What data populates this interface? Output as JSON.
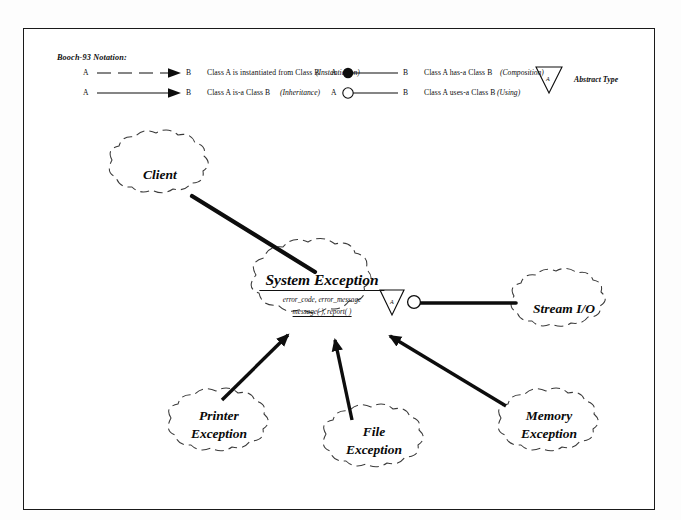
{
  "diagram": {
    "title": "Booch-93 Notation:",
    "legend": {
      "rows": [
        {
          "from": "A",
          "to": "B",
          "description": "Class A  is instantiated from  Class B",
          "kind": "(Instantiation)",
          "symbol": "dashed-arrow-icon"
        },
        {
          "from": "A",
          "to": "B",
          "description": "Class A  is-a Class B",
          "kind": "(Inheritance)",
          "symbol": "solid-arrow-icon"
        },
        {
          "from": "A",
          "to": "B",
          "description": "Class A  has-a  Class B",
          "kind": "(Composition)",
          "symbol": "filled-circle-line-icon"
        },
        {
          "from": "A",
          "to": "B",
          "description": "Class A  uses-a  Class B",
          "kind": "(Using)",
          "symbol": "open-circle-line-icon"
        }
      ],
      "abstract_type": {
        "label": "Abstract Type",
        "marker": "A",
        "symbol": "inverted-triangle-icon"
      }
    },
    "classes": [
      {
        "id": "client",
        "name": "Client",
        "attributes": "",
        "operations": "",
        "abstract": false
      },
      {
        "id": "system-exception",
        "name": "System Exception",
        "attributes": "error_code, error_message",
        "operations": "message( ), report( )",
        "abstract": true,
        "abstract_marker": "A"
      },
      {
        "id": "stream-io",
        "name": "Stream I/O",
        "attributes": "",
        "operations": "",
        "abstract": false
      },
      {
        "id": "printer-exception",
        "name_line1": "Printer",
        "name_line2": "Exception",
        "attributes": "",
        "operations": "",
        "abstract": false
      },
      {
        "id": "file-exception",
        "name_line1": "File",
        "name_line2": "Exception",
        "attributes": "",
        "operations": "",
        "abstract": false
      },
      {
        "id": "memory-exception",
        "name_line1": "Memory",
        "name_line2": "Exception",
        "attributes": "",
        "operations": "",
        "abstract": false
      }
    ],
    "relationships": [
      {
        "from": "client",
        "to": "system-exception",
        "type": "using"
      },
      {
        "from": "system-exception",
        "to": "stream-io",
        "type": "using"
      },
      {
        "from": "printer-exception",
        "to": "system-exception",
        "type": "inheritance"
      },
      {
        "from": "file-exception",
        "to": "system-exception",
        "type": "inheritance"
      },
      {
        "from": "memory-exception",
        "to": "system-exception",
        "type": "inheritance"
      }
    ],
    "colors": {
      "ink": "#0d0d0d",
      "frame": "#1a1a1a",
      "background": "#ffffff"
    }
  }
}
